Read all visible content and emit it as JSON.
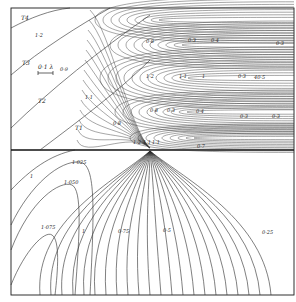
{
  "figure": {
    "type": "contour-diagram",
    "upper_region": {
      "field_labels": [
        "T4",
        "T3",
        "T2",
        "T1"
      ],
      "scale_bar_label": "0·1 λ",
      "contour_labels": [
        "1·2",
        "0·9",
        "1·1",
        "0·8",
        "1·1",
        "1",
        "0·3",
        "0·4",
        "0·3",
        "1·2",
        "1·1",
        "1",
        "0·3",
        "40·5",
        "0·4",
        "0·3",
        "0·3",
        "0·3",
        "0·3",
        "1·1",
        "1·2"
      ],
      "band_labels": {
        "top_band": [
          "0·8",
          "0·3",
          "0·4",
          "0·3"
        ],
        "middle_lobe": [
          "1·2",
          "1·1",
          "1",
          "0·3",
          "40·5"
        ],
        "lower_band": [
          "0·8",
          "0·3",
          "0·4",
          "0·3",
          "0·3"
        ],
        "near_source": [
          "1·2",
          "1·1",
          "1·1",
          "0·7",
          "1·1"
        ]
      }
    },
    "lower_region": {
      "contour_labels": [
        "1",
        "1·025",
        "1·050",
        "1·075",
        "1",
        "0·75",
        "0·5",
        "0·25"
      ]
    }
  }
}
